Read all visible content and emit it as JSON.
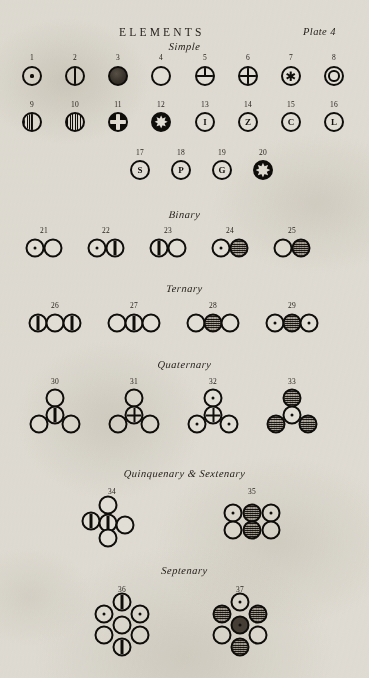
{
  "plate": {
    "title": "ELEMENTS",
    "plate_label": "Plate 4"
  },
  "sections": [
    {
      "id": "simple",
      "label": "Simple"
    },
    {
      "id": "binary",
      "label": "Binary"
    },
    {
      "id": "ternary",
      "label": "Ternary"
    },
    {
      "id": "quaternary",
      "label": "Quaternary"
    },
    {
      "id": "quinq_sext",
      "label": "Quinquenary & Sextenary"
    },
    {
      "id": "septenary",
      "label": "Septenary"
    }
  ],
  "numbers": {
    "n1": "1",
    "n2": "2",
    "n3": "3",
    "n4": "4",
    "n5": "5",
    "n6": "6",
    "n7": "7",
    "n8": "8",
    "n9": "9",
    "n10": "10",
    "n11": "11",
    "n12": "12",
    "n13": "13",
    "n14": "14",
    "n15": "15",
    "n16": "16",
    "n17": "17",
    "n18": "18",
    "n19": "19",
    "n20": "20",
    "n21": "21",
    "n22": "22",
    "n23": "23",
    "n24": "24",
    "n25": "25",
    "n26": "26",
    "n27": "27",
    "n28": "28",
    "n29": "29",
    "n30": "30",
    "n31": "31",
    "n32": "32",
    "n33": "33",
    "n34": "34",
    "n35": "35",
    "n36": "36",
    "n37": "37"
  },
  "letters": {
    "l13": "I",
    "l14": "Z",
    "l15": "C",
    "l16": "L",
    "l17": "S",
    "l18": "P",
    "l19": "G"
  },
  "glyphs": {
    "star": "✱",
    "burst": "✸"
  },
  "colors": {
    "ink": "#100e0b",
    "paper": "#e9e7e1",
    "shaded_atom": "#8e8880"
  },
  "symbol_legend": {
    "simple": [
      {
        "num": "1",
        "fill": "dot"
      },
      {
        "num": "2",
        "fill": "vline"
      },
      {
        "num": "3",
        "fill": "blob"
      },
      {
        "num": "4",
        "fill": "plain"
      },
      {
        "num": "5",
        "fill": "mercedes"
      },
      {
        "num": "6",
        "fill": "cross"
      },
      {
        "num": "7",
        "fill": "star"
      },
      {
        "num": "8",
        "fill": "ring"
      },
      {
        "num": "9",
        "fill": "vline-half-hatch"
      },
      {
        "num": "10",
        "fill": "hatch"
      },
      {
        "num": "11",
        "fill": "cross-white"
      },
      {
        "num": "12",
        "fill": "burst"
      },
      {
        "num": "13",
        "fill": "letter-I"
      },
      {
        "num": "14",
        "fill": "letter-Z"
      },
      {
        "num": "15",
        "fill": "letter-C"
      },
      {
        "num": "16",
        "fill": "letter-L"
      },
      {
        "num": "17",
        "fill": "letter-S"
      },
      {
        "num": "18",
        "fill": "letter-P"
      },
      {
        "num": "19",
        "fill": "letter-G"
      },
      {
        "num": "20",
        "fill": "burst-solid"
      }
    ],
    "binary": [
      {
        "num": "21",
        "atoms": [
          "dot",
          "plain"
        ]
      },
      {
        "num": "22",
        "atoms": [
          "dot",
          "vline"
        ]
      },
      {
        "num": "23",
        "atoms": [
          "vline",
          "plain"
        ]
      },
      {
        "num": "24",
        "atoms": [
          "dot",
          "shaded"
        ]
      },
      {
        "num": "25",
        "atoms": [
          "plain",
          "shaded"
        ]
      }
    ],
    "ternary": [
      {
        "num": "26",
        "atoms": [
          "vline",
          "plain",
          "vline"
        ]
      },
      {
        "num": "27",
        "atoms": [
          "plain",
          "vline",
          "plain"
        ]
      },
      {
        "num": "28",
        "atoms": [
          "plain",
          "shaded",
          "plain"
        ]
      },
      {
        "num": "29",
        "atoms": [
          "dot",
          "shaded",
          "dot"
        ]
      }
    ],
    "quaternary": [
      {
        "num": "30",
        "atoms": [
          "plain",
          "vline",
          "plain",
          "plain"
        ]
      },
      {
        "num": "31",
        "atoms": [
          "plain",
          "cross",
          "plain",
          "plain"
        ]
      },
      {
        "num": "32",
        "atoms": [
          "dot",
          "cross",
          "dot",
          "dot"
        ]
      },
      {
        "num": "33",
        "atoms": [
          "shaded",
          "dot",
          "shaded",
          "shaded"
        ]
      }
    ],
    "quinquenary_sextenary": [
      {
        "num": "34",
        "atoms": [
          "plain",
          "vline",
          "vline",
          "plain",
          "plain"
        ]
      },
      {
        "num": "35",
        "atoms": [
          "dot",
          "shaded",
          "dot",
          "plain",
          "shaded",
          "plain"
        ]
      }
    ],
    "septenary": [
      {
        "num": "36",
        "atoms": [
          "vline",
          "dot",
          "dot",
          "plain",
          "plain",
          "plain",
          "vline"
        ]
      },
      {
        "num": "37",
        "atoms": [
          "dot",
          "shaded",
          "shaded",
          "plain",
          "plain",
          "shaded",
          "dot"
        ]
      }
    ]
  }
}
